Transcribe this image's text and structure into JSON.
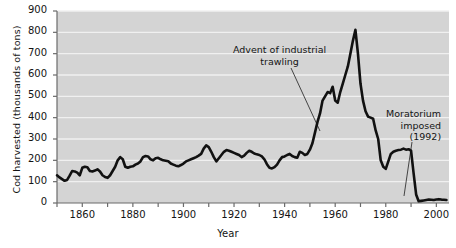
{
  "chart_data": {
    "type": "line",
    "title": "",
    "xlabel": "Year",
    "ylabel": "Cod harvested (thousands of tons)",
    "xlim": [
      1850,
      2005
    ],
    "ylim": [
      0,
      900
    ],
    "xticks": [
      1850,
      1860,
      1870,
      1880,
      1890,
      1900,
      1910,
      1920,
      1930,
      1940,
      1950,
      1960,
      1970,
      1980,
      1990,
      2000
    ],
    "xticklabels": [
      "",
      "1860",
      "",
      "1880",
      "",
      "1900",
      "",
      "1920",
      "",
      "1940",
      "",
      "1960",
      "",
      "1980",
      "",
      "2000"
    ],
    "yticks": [
      0,
      100,
      200,
      300,
      400,
      500,
      600,
      700,
      800,
      900
    ],
    "yticklabels": [
      "0",
      "100",
      "200",
      "300",
      "400",
      "500",
      "600",
      "700",
      "800",
      "900"
    ],
    "grid": "horizontal-white-on-grey",
    "plot_background": "#d4d4d4",
    "line_color": "#111111",
    "line_width": 2.6,
    "series": [
      {
        "name": "Cod harvested",
        "x": [
          1850,
          1851,
          1852,
          1853,
          1854,
          1855,
          1856,
          1857,
          1858,
          1859,
          1860,
          1861,
          1862,
          1863,
          1864,
          1865,
          1866,
          1867,
          1868,
          1869,
          1870,
          1871,
          1872,
          1873,
          1874,
          1875,
          1876,
          1877,
          1878,
          1879,
          1880,
          1881,
          1882,
          1883,
          1884,
          1885,
          1886,
          1887,
          1888,
          1889,
          1890,
          1891,
          1892,
          1893,
          1894,
          1895,
          1896,
          1897,
          1898,
          1899,
          1900,
          1901,
          1902,
          1903,
          1904,
          1905,
          1906,
          1907,
          1908,
          1909,
          1910,
          1911,
          1912,
          1913,
          1914,
          1915,
          1916,
          1917,
          1918,
          1919,
          1920,
          1921,
          1922,
          1923,
          1924,
          1925,
          1926,
          1927,
          1928,
          1929,
          1930,
          1931,
          1932,
          1933,
          1934,
          1935,
          1936,
          1937,
          1938,
          1939,
          1940,
          1941,
          1942,
          1943,
          1944,
          1945,
          1946,
          1947,
          1948,
          1949,
          1950,
          1951,
          1952,
          1953,
          1954,
          1955,
          1956,
          1957,
          1958,
          1959,
          1960,
          1961,
          1962,
          1963,
          1964,
          1965,
          1966,
          1967,
          1968,
          1969,
          1970,
          1971,
          1972,
          1973,
          1974,
          1975,
          1976,
          1977,
          1978,
          1979,
          1980,
          1981,
          1982,
          1983,
          1984,
          1985,
          1986,
          1987,
          1988,
          1989,
          1990,
          1991,
          1992,
          1993,
          1994,
          1995,
          1996,
          1997,
          1998,
          1999,
          2000,
          2001,
          2002,
          2003,
          2004
        ],
        "values": [
          130,
          120,
          112,
          104,
          108,
          128,
          150,
          148,
          142,
          130,
          165,
          170,
          168,
          150,
          148,
          152,
          158,
          148,
          130,
          122,
          118,
          130,
          150,
          170,
          200,
          215,
          205,
          170,
          165,
          170,
          172,
          180,
          185,
          195,
          215,
          220,
          218,
          205,
          200,
          210,
          212,
          205,
          200,
          198,
          196,
          185,
          180,
          175,
          172,
          178,
          185,
          195,
          200,
          205,
          210,
          215,
          222,
          230,
          255,
          270,
          262,
          240,
          215,
          195,
          210,
          225,
          240,
          248,
          245,
          240,
          235,
          230,
          225,
          215,
          222,
          235,
          245,
          240,
          232,
          228,
          225,
          218,
          205,
          182,
          165,
          162,
          168,
          180,
          200,
          215,
          218,
          225,
          230,
          220,
          215,
          212,
          240,
          235,
          225,
          230,
          250,
          280,
          330,
          380,
          420,
          480,
          500,
          520,
          515,
          545,
          480,
          470,
          520,
          560,
          600,
          640,
          700,
          760,
          812,
          700,
          560,
          480,
          430,
          405,
          400,
          395,
          340,
          300,
          200,
          170,
          160,
          195,
          230,
          240,
          245,
          248,
          250,
          255,
          250,
          252,
          245,
          140,
          40,
          8,
          10,
          12,
          14,
          16,
          15,
          14,
          16,
          18,
          16,
          15,
          14
        ],
        "annotations": [
          {
            "text": "Advent of industrial trawling",
            "year": 1957,
            "value": 300
          },
          {
            "text": "Moratorium imposed (1992)",
            "year": 1992,
            "value": 0
          }
        ]
      }
    ]
  },
  "annotations": {
    "trawling": {
      "line1": "Advent of industrial",
      "line2": "trawling"
    },
    "moratorium": {
      "line1": "Moratorium",
      "line2": "imposed",
      "line3": "(1992)"
    }
  },
  "axes": {
    "x_title": "Year",
    "y_title": "Cod harvested (thousands of tons)"
  }
}
